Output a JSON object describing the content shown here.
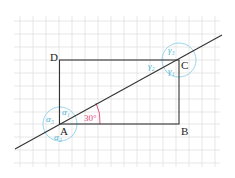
{
  "diagram": {
    "vertices": {
      "A": "A",
      "B": "B",
      "C": "C",
      "D": "D"
    },
    "angle_label": "30°",
    "greek_at_A": [
      "α₁",
      "α₂",
      "α₃"
    ],
    "greek_at_C": [
      "γ₁",
      "γ₂",
      "γ₃"
    ],
    "colors": {
      "grid": "#d9d9d9",
      "lines": "#333333",
      "circles": "#7fc8e3",
      "angle": "#e0457b"
    }
  }
}
